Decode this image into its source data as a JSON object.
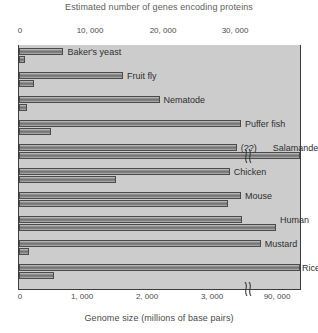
{
  "chart_data": {
    "type": "bar",
    "title": "",
    "top_axis": {
      "label": "Estimated number of genes encoding proteins",
      "ticks": [
        0,
        10000,
        20000,
        30000
      ],
      "tick_labels": [
        "0",
        "10, 000",
        "20, 000",
        "30, 000"
      ],
      "range": [
        0,
        38000
      ]
    },
    "bottom_axis": {
      "label": "Genome size (millions of base pairs)",
      "ticks": [
        1000,
        2000,
        3000,
        90000
      ],
      "tick_labels": [
        "0",
        "1, 000",
        "2, 000",
        "3, 000",
        "90, 000"
      ],
      "range": [
        0,
        3500
      ],
      "broken": true,
      "break_after": 3300
    },
    "categories": [
      "Baker's yeast",
      "Fruit fly",
      "Nematode",
      "Puffer fish",
      "Salamander",
      "Chicken",
      "Mouse",
      "Human",
      "Mustard",
      "Rice"
    ],
    "series": [
      {
        "name": "Estimated number of genes encoding proteins",
        "unit": "genes",
        "values": [
          6000,
          14000,
          19000,
          30000,
          null,
          23000,
          25000,
          25000,
          26000,
          38000
        ],
        "value_labels": [
          "",
          "",
          "",
          "",
          "(??)",
          "",
          "",
          "",
          "",
          ""
        ]
      },
      {
        "name": "Genome size (millions of base pairs)",
        "unit": "millions of base pairs",
        "values": [
          12,
          180,
          100,
          400,
          90000,
          1200,
          2600,
          3200,
          120,
          430
        ],
        "value_labels": [
          "",
          "",
          "",
          "",
          "",
          "",
          "",
          "",
          "",
          ""
        ]
      }
    ],
    "legend": [],
    "grid": false
  },
  "rows": [
    {
      "name": "Baker's yeast",
      "gene_pct": 15.8,
      "genome_pct": 2.1,
      "label": "Baker's yeast",
      "gene_label": ""
    },
    {
      "name": "Fruit fly",
      "gene_pct": 37.0,
      "genome_pct": 5.3,
      "label": "Fruit fly",
      "gene_label": ""
    },
    {
      "name": "Nematode",
      "gene_pct": 50.0,
      "genome_pct": 3.0,
      "label": "Nematode",
      "gene_label": ""
    },
    {
      "name": "Puffer fish",
      "gene_pct": 79.0,
      "genome_pct": 11.5,
      "label": "Puffer fish",
      "gene_label": ""
    },
    {
      "name": "Salamander",
      "gene_pct": 77.5,
      "genome_pct": 100.0,
      "label": "Salamander",
      "gene_label": "(??)"
    },
    {
      "name": "Chicken",
      "gene_pct": 75.0,
      "genome_pct": 34.5,
      "label": "Chicken",
      "gene_label": ""
    },
    {
      "name": "Mouse",
      "gene_pct": 79.0,
      "genome_pct": 74.5,
      "label": "Mouse",
      "gene_label": ""
    },
    {
      "name": "Human",
      "gene_pct": 79.5,
      "genome_pct": 91.5,
      "label": "Human",
      "gene_label": ""
    },
    {
      "name": "Mustard",
      "gene_pct": 86.0,
      "genome_pct": 3.5,
      "label": "Mustard",
      "gene_label": ""
    },
    {
      "name": "Rice",
      "gene_pct": 100.0,
      "genome_pct": 12.5,
      "label": "Rice",
      "gene_label": ""
    }
  ],
  "colors": {
    "plot_background": "#cccccc",
    "bar_fill": "#8a8a8a",
    "bar_outline": "#4a4a4a",
    "axis": "#3c3c3c",
    "text": "#2e2e2e",
    "title_text": "#5e5e5e",
    "page_background": "#ffffff"
  }
}
